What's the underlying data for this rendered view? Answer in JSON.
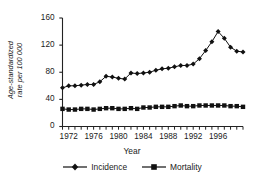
{
  "chart_data": {
    "type": "line",
    "title": "",
    "xlabel": "Year",
    "ylabel_line1": "Age-standardized",
    "ylabel_line2": "rate per 100 000",
    "ylabel": "Age-standardized rate per 100 000",
    "xlim": [
      1971,
      2000
    ],
    "ylim": [
      0,
      160
    ],
    "yticks": [
      0,
      40,
      80,
      120,
      160
    ],
    "ytick_labels": [
      "0",
      "40",
      "80",
      "120",
      "160"
    ],
    "xticks": [
      1972,
      1976,
      1980,
      1984,
      1988,
      1992,
      1996
    ],
    "xtick_labels": [
      "1972",
      "1976",
      "1980",
      "1984",
      "1988",
      "1992",
      "1996"
    ],
    "xtick_minor_step": 1,
    "grid": false,
    "legend_position": "bottom",
    "x": [
      1971,
      1972,
      1973,
      1974,
      1975,
      1976,
      1977,
      1978,
      1979,
      1980,
      1981,
      1982,
      1983,
      1984,
      1985,
      1986,
      1987,
      1988,
      1989,
      1990,
      1991,
      1992,
      1993,
      1994,
      1995,
      1996,
      1997,
      1998,
      1999,
      2000
    ],
    "series": [
      {
        "name": "Incidence",
        "marker": "diamond",
        "color": "#111111",
        "values": [
          57,
          60,
          60,
          61,
          62,
          62,
          66,
          74,
          73,
          71,
          70,
          79,
          78,
          79,
          80,
          83,
          85,
          86,
          88,
          90,
          90,
          92,
          100,
          112,
          125,
          140,
          130,
          117,
          111,
          110
        ]
      },
      {
        "name": "Mortality",
        "marker": "square",
        "color": "#111111",
        "values": [
          26,
          25,
          25,
          26,
          26,
          25,
          26,
          27,
          27,
          26,
          26,
          27,
          26,
          28,
          28,
          29,
          29,
          29,
          30,
          31,
          30,
          30,
          31,
          31,
          31,
          31,
          31,
          30,
          30,
          29
        ]
      }
    ]
  },
  "legend": {
    "incidence_label": "Incidence",
    "mortality_label": "Mortality"
  },
  "axes": {
    "x_title": "Year"
  }
}
